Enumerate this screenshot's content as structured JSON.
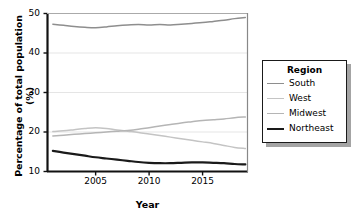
{
  "chart_data": {
    "type": "line",
    "title": "",
    "xlabel": "Year",
    "ylabel": "Percentage of total population (%)",
    "xlim": [
      2000.5,
      2019.2
    ],
    "ylim": [
      10,
      50
    ],
    "yticks": [
      10,
      20,
      30,
      40,
      50
    ],
    "xticks": [
      2005,
      2010,
      2015
    ],
    "grid": true,
    "legend_position": "right-outside",
    "legend_title": "Region",
    "x": [
      2001,
      2002,
      2003,
      2004,
      2005,
      2006,
      2007,
      2008,
      2009,
      2010,
      2011,
      2012,
      2013,
      2014,
      2015,
      2016,
      2017,
      2018,
      2019
    ],
    "series": [
      {
        "name": "South",
        "color": "#8e8e8e",
        "values": [
          47.3,
          47.0,
          46.7,
          46.5,
          46.4,
          46.6,
          46.9,
          47.1,
          47.2,
          47.1,
          47.2,
          47.1,
          47.3,
          47.5,
          47.7,
          48.0,
          48.3,
          48.7,
          49.0
        ]
      },
      {
        "name": "West",
        "color": "#c4c4c4",
        "values": [
          20.1,
          20.3,
          20.6,
          20.9,
          21.1,
          20.9,
          20.5,
          20.2,
          19.9,
          19.5,
          19.1,
          18.7,
          18.3,
          17.9,
          17.5,
          17.1,
          16.6,
          16.1,
          15.8
        ]
      },
      {
        "name": "Midwest",
        "color": "#b5b5b5",
        "values": [
          19.0,
          19.2,
          19.4,
          19.6,
          19.8,
          20.0,
          20.2,
          20.4,
          20.7,
          21.1,
          21.5,
          21.9,
          22.3,
          22.6,
          22.9,
          23.1,
          23.3,
          23.6,
          23.8
        ]
      },
      {
        "name": "Northeast",
        "color": "#1a1a1a",
        "values": [
          15.2,
          14.8,
          14.4,
          14.0,
          13.6,
          13.3,
          13.0,
          12.7,
          12.4,
          12.2,
          12.1,
          12.1,
          12.2,
          12.3,
          12.3,
          12.2,
          12.1,
          11.9,
          11.8
        ]
      }
    ]
  },
  "legend": {
    "title": "Region",
    "items": [
      {
        "label": "South",
        "color": "#8e8e8e"
      },
      {
        "label": "West",
        "color": "#c4c4c4"
      },
      {
        "label": "Midwest",
        "color": "#b5b5b5"
      },
      {
        "label": "Northeast",
        "color": "#1a1a1a"
      }
    ]
  },
  "axes": {
    "ylabel": "Percentage of total population (%)",
    "xlabel": "Year",
    "yticks": [
      "10",
      "20",
      "30",
      "40",
      "50"
    ],
    "xticks": [
      "2005",
      "2010",
      "2015"
    ]
  }
}
